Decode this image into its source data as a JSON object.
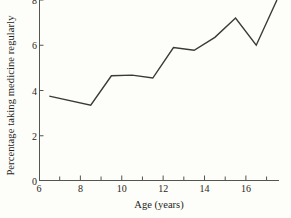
{
  "chart_data": {
    "type": "line",
    "title": "",
    "xlabel": "Age (years)",
    "ylabel": "Percentage taking medicine regularly",
    "xlim": [
      6,
      17.6
    ],
    "ylim": [
      0,
      8
    ],
    "xticks": [
      6,
      8,
      10,
      12,
      14,
      16
    ],
    "xtick_labels": [
      "6",
      "8",
      "10",
      "12",
      "14",
      "16"
    ],
    "xminorticks": [
      7,
      9,
      11,
      13,
      15,
      17
    ],
    "yticks": [
      0,
      2,
      4,
      6,
      8
    ],
    "ytick_labels": [
      "0",
      "2",
      "4",
      "6",
      "8"
    ],
    "grid": false,
    "legend": null,
    "series": [
      {
        "name": "Percentage taking medicine regularly",
        "color": "#3a3a38",
        "x": [
          6.5,
          8.5,
          9.5,
          10.5,
          11.5,
          12.5,
          13.5,
          14.5,
          15.5,
          16.5,
          17.5
        ],
        "values": [
          3.75,
          3.35,
          4.65,
          4.68,
          4.55,
          5.9,
          5.78,
          6.35,
          7.2,
          6.0,
          8.0
        ]
      }
    ]
  },
  "axis": {
    "line_color": "#55554e",
    "tick_color": "#55554e"
  }
}
